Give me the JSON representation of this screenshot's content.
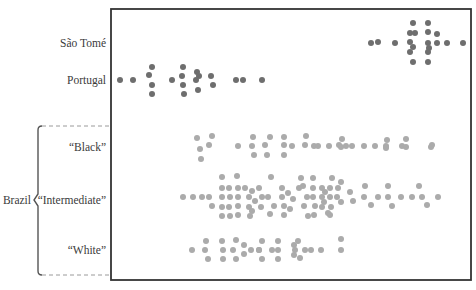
{
  "chart_data": {
    "type": "scatter",
    "subtype": "beeswarm / strip plot",
    "title": "",
    "xlabel": "",
    "ylabel": "",
    "grid": false,
    "legend": null,
    "frame": {
      "left": 111,
      "top": 9,
      "right": 471,
      "bottom": 280
    },
    "colors": {
      "dark": "#6e6e6e",
      "light": "#ababab",
      "frame": "#333333",
      "bracket": "#555555",
      "dash": "#9a9a9a"
    },
    "categories": [
      "São Tomé",
      "Portugal",
      "“Black”",
      "“Intermediate”",
      "“White”"
    ],
    "group_label": "Brazil",
    "group_members": [
      "“Black”",
      "“Intermediate”",
      "“White”"
    ],
    "series": [
      {
        "name": "São Tomé",
        "label_y": 43,
        "color": "dark",
        "points": [
          [
            371,
            43
          ],
          [
            378,
            42
          ],
          [
            395,
            43
          ],
          [
            413,
            23
          ],
          [
            428,
            23
          ],
          [
            410,
            33
          ],
          [
            415,
            33
          ],
          [
            428,
            32
          ],
          [
            437,
            34
          ],
          [
            410,
            42
          ],
          [
            413,
            47
          ],
          [
            428,
            43
          ],
          [
            437,
            43
          ],
          [
            447,
            43
          ],
          [
            463,
            43
          ],
          [
            429,
            48
          ],
          [
            410,
            52
          ],
          [
            428,
            52
          ],
          [
            413,
            62
          ],
          [
            428,
            62
          ]
        ]
      },
      {
        "name": "Portugal",
        "label_y": 80,
        "color": "dark",
        "points": [
          [
            120,
            80
          ],
          [
            133,
            80
          ],
          [
            152,
            67
          ],
          [
            149,
            75
          ],
          [
            152,
            85
          ],
          [
            152,
            94
          ],
          [
            172,
            80
          ],
          [
            183,
            67
          ],
          [
            182,
            76
          ],
          [
            183,
            85
          ],
          [
            184,
            94
          ],
          [
            197,
            72
          ],
          [
            199,
            76
          ],
          [
            196,
            80
          ],
          [
            198,
            90
          ],
          [
            211,
            76
          ],
          [
            213,
            85
          ],
          [
            236,
            80
          ],
          [
            243,
            80
          ],
          [
            262,
            80
          ]
        ]
      },
      {
        "name": "“Black”",
        "label_y": 147,
        "color": "light",
        "points": [
          [
            197,
            138
          ],
          [
            212,
            136
          ],
          [
            200,
            149
          ],
          [
            209,
            145
          ],
          [
            201,
            159
          ],
          [
            238,
            146
          ],
          [
            253,
            137
          ],
          [
            252,
            146
          ],
          [
            254,
            155
          ],
          [
            270,
            137
          ],
          [
            265,
            145
          ],
          [
            267,
            155
          ],
          [
            284,
            137
          ],
          [
            284,
            145
          ],
          [
            284,
            155
          ],
          [
            292,
            146
          ],
          [
            306,
            136
          ],
          [
            305,
            145
          ],
          [
            314,
            146
          ],
          [
            318,
            146
          ],
          [
            329,
            146
          ],
          [
            339,
            145
          ],
          [
            342,
            139
          ],
          [
            341,
            147
          ],
          [
            346,
            146
          ],
          [
            352,
            146
          ],
          [
            364,
            146
          ],
          [
            375,
            146
          ],
          [
            386,
            146
          ],
          [
            387,
            140
          ],
          [
            386,
            148
          ],
          [
            402,
            146
          ],
          [
            406,
            139
          ],
          [
            406,
            147
          ],
          [
            431,
            147
          ],
          [
            432,
            145
          ]
        ]
      },
      {
        "name": "“Intermediate”",
        "label_y": 200,
        "color": "light",
        "points": [
          [
            183,
            197
          ],
          [
            193,
            197
          ],
          [
            202,
            197
          ],
          [
            209,
            197
          ],
          [
            222,
            177
          ],
          [
            222,
            188
          ],
          [
            222,
            197
          ],
          [
            222,
            207
          ],
          [
            222,
            216
          ],
          [
            212,
            206
          ],
          [
            229,
            188
          ],
          [
            230,
            197
          ],
          [
            229,
            207
          ],
          [
            230,
            216
          ],
          [
            237,
            176
          ],
          [
            238,
            188
          ],
          [
            238,
            197
          ],
          [
            238,
            206
          ],
          [
            238,
            215
          ],
          [
            245,
            188
          ],
          [
            249,
            197
          ],
          [
            249,
            207
          ],
          [
            252,
            191
          ],
          [
            255,
            201
          ],
          [
            252,
            211
          ],
          [
            259,
            188
          ],
          [
            262,
            197
          ],
          [
            261,
            207
          ],
          [
            250,
            216
          ],
          [
            271,
            177
          ],
          [
            268,
            197
          ],
          [
            274,
            206
          ],
          [
            270,
            214
          ],
          [
            282,
            188
          ],
          [
            282,
            197
          ],
          [
            284,
            206
          ],
          [
            284,
            215
          ],
          [
            288,
            193
          ],
          [
            293,
            199
          ],
          [
            290,
            209
          ],
          [
            299,
            188
          ],
          [
            301,
            178
          ],
          [
            303,
            186
          ],
          [
            307,
            197
          ],
          [
            304,
            206
          ],
          [
            308,
            216
          ],
          [
            313,
            178
          ],
          [
            313,
            188
          ],
          [
            313,
            197
          ],
          [
            315,
            206
          ],
          [
            314,
            215
          ],
          [
            322,
            188
          ],
          [
            322,
            197
          ],
          [
            322,
            207
          ],
          [
            325,
            192
          ],
          [
            324,
            202
          ],
          [
            328,
            213
          ],
          [
            332,
            178
          ],
          [
            330,
            188
          ],
          [
            330,
            197
          ],
          [
            331,
            207
          ],
          [
            330,
            215
          ],
          [
            338,
            188
          ],
          [
            337,
            197
          ],
          [
            341,
            182
          ],
          [
            341,
            202
          ],
          [
            350,
            192
          ],
          [
            353,
            201
          ],
          [
            365,
            186
          ],
          [
            364,
            197
          ],
          [
            371,
            205
          ],
          [
            378,
            197
          ],
          [
            388,
            186
          ],
          [
            388,
            197
          ],
          [
            392,
            206
          ],
          [
            401,
            197
          ],
          [
            412,
            197
          ],
          [
            419,
            186
          ],
          [
            422,
            197
          ],
          [
            427,
            205
          ],
          [
            438,
            197
          ]
        ]
      },
      {
        "name": "“White”",
        "label_y": 250,
        "color": "light",
        "points": [
          [
            192,
            250
          ],
          [
            206,
            241
          ],
          [
            205,
            250
          ],
          [
            208,
            259
          ],
          [
            222,
            241
          ],
          [
            223,
            250
          ],
          [
            223,
            259
          ],
          [
            236,
            240
          ],
          [
            233,
            250
          ],
          [
            236,
            259
          ],
          [
            244,
            245
          ],
          [
            244,
            254
          ],
          [
            251,
            250
          ],
          [
            259,
            250
          ],
          [
            262,
            241
          ],
          [
            259,
            250
          ],
          [
            262,
            259
          ],
          [
            272,
            250
          ],
          [
            278,
            241
          ],
          [
            278,
            250
          ],
          [
            278,
            259
          ],
          [
            294,
            245
          ],
          [
            295,
            250
          ],
          [
            298,
            241
          ],
          [
            294,
            255
          ],
          [
            300,
            258
          ],
          [
            305,
            250
          ],
          [
            311,
            250
          ],
          [
            321,
            250
          ],
          [
            341,
            239
          ],
          [
            341,
            250
          ]
        ]
      }
    ]
  }
}
